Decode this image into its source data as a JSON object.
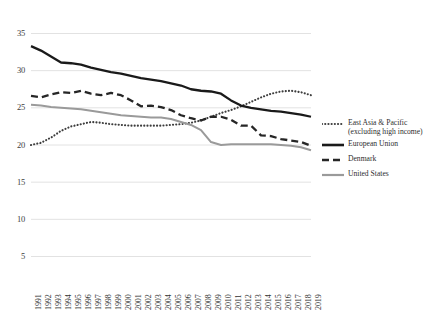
{
  "chart_data": {
    "type": "line",
    "title": "",
    "xlabel": "",
    "ylabel": "",
    "ylim": [
      0,
      35
    ],
    "xlim": [
      1991,
      2019
    ],
    "grid": true,
    "legend_position": "right",
    "yticks": [
      5,
      10,
      15,
      20,
      25,
      30,
      35
    ],
    "categories": [
      1991,
      1992,
      1993,
      1994,
      1995,
      1996,
      1997,
      1998,
      1999,
      2000,
      2001,
      2002,
      2003,
      2004,
      2005,
      2006,
      2007,
      2008,
      2009,
      2010,
      2011,
      2012,
      2013,
      2014,
      2015,
      2016,
      2017,
      2018,
      2019
    ],
    "series": [
      {
        "name": "East Asia & Pacific (excluding high income)",
        "style": "dotted",
        "color": "#3d3d3d",
        "values": [
          20.0,
          20.3,
          21.0,
          21.9,
          22.5,
          22.8,
          23.1,
          23.0,
          22.8,
          22.7,
          22.6,
          22.6,
          22.6,
          22.6,
          22.7,
          22.8,
          23.0,
          23.3,
          23.8,
          24.3,
          24.7,
          25.2,
          25.8,
          26.4,
          26.9,
          27.2,
          27.3,
          27.1,
          26.7
        ]
      },
      {
        "name": "European Union",
        "style": "solid",
        "color": "#1a1a1a",
        "values": [
          33.3,
          32.7,
          31.9,
          31.1,
          31.0,
          30.8,
          30.4,
          30.1,
          29.8,
          29.6,
          29.3,
          29.0,
          28.8,
          28.6,
          28.3,
          28.0,
          27.5,
          27.3,
          27.2,
          26.9,
          26.0,
          25.3,
          25.0,
          24.8,
          24.6,
          24.5,
          24.3,
          24.1,
          23.8
        ]
      },
      {
        "name": "Denmark",
        "style": "dashed",
        "color": "#262626",
        "values": [
          26.6,
          26.4,
          26.8,
          27.1,
          27.0,
          27.3,
          26.9,
          26.7,
          27.0,
          26.7,
          26.0,
          25.2,
          25.3,
          25.1,
          24.7,
          24.0,
          23.6,
          23.3,
          23.8,
          23.8,
          23.4,
          22.6,
          22.6,
          21.3,
          21.2,
          20.8,
          20.6,
          20.4,
          19.9
        ]
      },
      {
        "name": "United States",
        "style": "solid",
        "color": "#9a9a9a",
        "values": [
          25.4,
          25.3,
          25.1,
          25.0,
          24.9,
          24.8,
          24.6,
          24.4,
          24.2,
          24.0,
          23.9,
          23.8,
          23.7,
          23.7,
          23.5,
          23.1,
          22.7,
          22.0,
          20.4,
          20.0,
          20.1,
          20.1,
          20.1,
          20.1,
          20.1,
          20.0,
          19.9,
          19.7,
          19.3
        ]
      }
    ]
  },
  "legend": {
    "items": [
      {
        "label": "East Asia & Pacific (excluding high income)",
        "key": "dotted-line-key"
      },
      {
        "label": "European Union",
        "key": "solid-black-line-key"
      },
      {
        "label": "Denmark",
        "key": "dashed-line-key"
      },
      {
        "label": "United States",
        "key": "solid-gray-line-key"
      }
    ]
  },
  "axis": {
    "y_tick_labels": [
      "35",
      "30",
      "25",
      "20",
      "15",
      "10",
      "5"
    ],
    "x_tick_labels": [
      "1991",
      "1992",
      "1993",
      "1994",
      "1995",
      "1996",
      "1997",
      "1998",
      "1999",
      "2000",
      "2001",
      "2002",
      "2003",
      "2004",
      "2005",
      "2006",
      "2007",
      "2008",
      "2009",
      "2010",
      "2011",
      "2012",
      "2013",
      "2014",
      "2015",
      "2016",
      "2017",
      "2018",
      "2019"
    ]
  },
  "colors": {
    "gridline": "#e2e2e2",
    "background": "#ffffff",
    "east_asia": "#3d3d3d",
    "european_union": "#1a1a1a",
    "denmark": "#262626",
    "united_states": "#9a9a9a"
  }
}
